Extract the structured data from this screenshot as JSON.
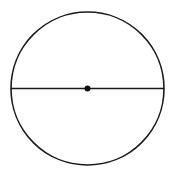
{
  "diagram": {
    "type": "geometry",
    "shapes": {
      "circle": {
        "cx": 87.5,
        "cy": 88.5,
        "r": 76.5,
        "stroke": "#1a1a1a",
        "stroke_width": 1.6
      },
      "diameter": {
        "x1": 11,
        "y1": 88.5,
        "x2": 164,
        "y2": 88.5,
        "stroke": "#1a1a1a",
        "stroke_width": 1.6
      },
      "center_point": {
        "cx": 87.5,
        "cy": 88.5,
        "r": 3,
        "fill": "#111111"
      }
    },
    "background": "#ffffff"
  }
}
